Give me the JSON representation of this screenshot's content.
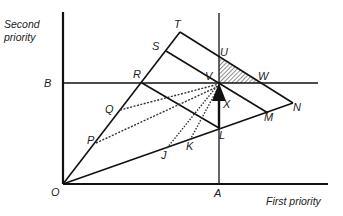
{
  "diagram": {
    "axes": {
      "x_label": "First priority",
      "y_label_line1": "Second",
      "y_label_line2": "priority"
    },
    "points": {
      "O": "O",
      "A": "A",
      "B": "B",
      "T": "T",
      "S": "S",
      "R": "R",
      "Q": "Q",
      "P": "P",
      "U": "U",
      "V": "V",
      "W": "W",
      "N": "N",
      "M": "M",
      "L": "L",
      "K": "K",
      "J": "J",
      "X": "X"
    },
    "colors": {
      "line": "#111111",
      "background": "#ffffff"
    }
  }
}
